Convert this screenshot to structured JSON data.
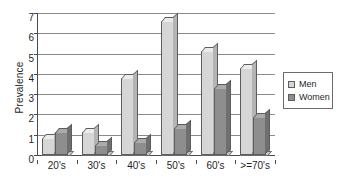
{
  "chart_data": {
    "type": "bar",
    "title": "",
    "xlabel": "",
    "ylabel": "Prevalence",
    "ylim": [
      0,
      7
    ],
    "ytick_labels": [
      "0",
      "1",
      "2",
      "3",
      "4",
      "5",
      "6",
      "7"
    ],
    "grid": true,
    "legend_position": "right",
    "categories": [
      "20's",
      "30's",
      "40's",
      "50's",
      "60's",
      ">=70's"
    ],
    "series": [
      {
        "name": "Men",
        "color": "#d6d6d6",
        "values": [
          0.85,
          1.15,
          3.8,
          6.6,
          5.15,
          4.3
        ]
      },
      {
        "name": "Women",
        "color": "#8e8e8e",
        "values": [
          1.15,
          0.5,
          0.65,
          1.35,
          3.3,
          1.85
        ]
      }
    ]
  },
  "legend": {
    "items": [
      {
        "label": "Men",
        "swatch": "men"
      },
      {
        "label": "Women",
        "swatch": "women"
      }
    ]
  }
}
